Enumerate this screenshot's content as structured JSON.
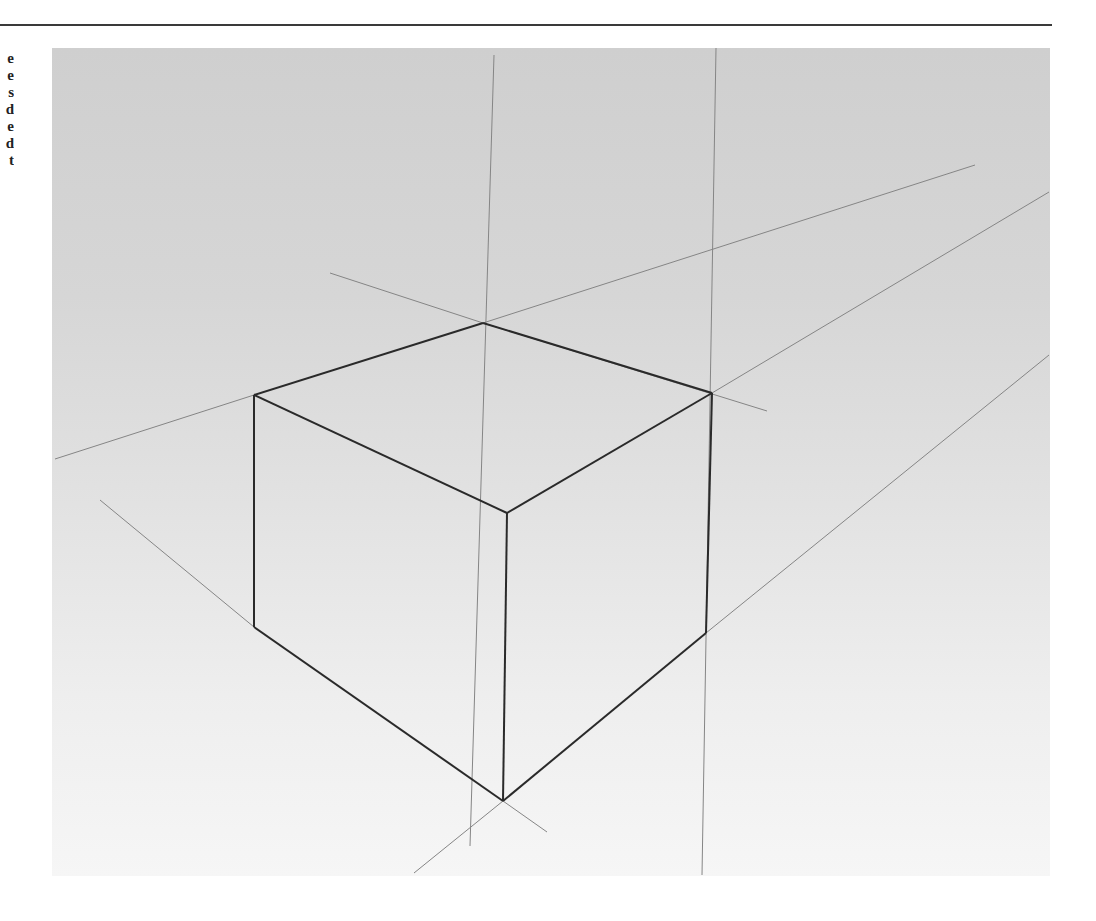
{
  "page": {
    "margin_text_fragments": [
      "e",
      "e",
      "s",
      "d",
      "e",
      "d",
      "t"
    ]
  },
  "figure": {
    "colors": {
      "paper_top": "#cfcfcf",
      "paper_bottom": "#f6f6f6",
      "edge": "#2a2a2a",
      "guide": "#7a7a7a"
    },
    "cube_vertices": {
      "back_top": [
        483,
        323
      ],
      "left_top": [
        254,
        395
      ],
      "right_top": [
        712,
        393
      ],
      "front_top": [
        507,
        513
      ],
      "left_bottom": [
        254,
        627
      ],
      "right_bottom": [
        706,
        633
      ],
      "front_bottom": [
        503,
        801
      ]
    }
  }
}
